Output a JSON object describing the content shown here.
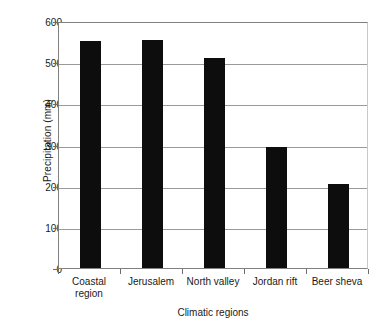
{
  "chart_data": {
    "type": "bar",
    "title": "",
    "xlabel": "Climatic regions",
    "ylabel": "Precipitation (mm)",
    "categories": [
      "Coastal region",
      "Jerusalem",
      "North valley",
      "Jordan rift",
      "Beer sheva"
    ],
    "category_lines": [
      [
        "Coastal",
        "region"
      ],
      [
        "Jerusalem"
      ],
      [
        "North valley"
      ],
      [
        "Jordan rift"
      ],
      [
        "Beer sheva"
      ]
    ],
    "values": [
      552,
      555,
      510,
      295,
      205
    ],
    "ylim": [
      0,
      600
    ],
    "yticks": [
      0,
      100,
      200,
      300,
      400,
      500,
      600
    ],
    "ytick_labels": [
      "0",
      "100",
      "200",
      "300",
      "400",
      "500",
      "600"
    ],
    "grid": true,
    "legend": "none",
    "bar_color": "#0d0d0d",
    "axis_color": "#808080",
    "gridline_color": "#9a9a9a",
    "background": "#ffffff"
  }
}
